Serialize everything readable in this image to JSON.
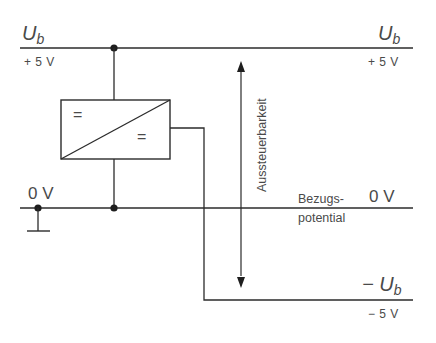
{
  "diagram": {
    "type": "circuit-schematic",
    "rails": {
      "top_left": {
        "symbol": "U",
        "subscript": "b",
        "voltage": "+ 5 V"
      },
      "top_right": {
        "symbol": "U",
        "subscript": "b",
        "voltage": "+ 5 V"
      },
      "bottom_right": {
        "symbol": "− U",
        "subscript": "b",
        "voltage": "− 5 V"
      },
      "ground_left": {
        "voltage": "0 V"
      },
      "ground_right": {
        "voltage": "0 V"
      }
    },
    "converter": {
      "input_symbol": "=",
      "output_symbol": "="
    },
    "labels": {
      "swing": "Aussteuerbarkeit",
      "reference_line1": "Bezugs-",
      "reference_line2": "potential"
    },
    "colors": {
      "line": "#2b2b2b",
      "text": "#4a4a4a",
      "background": "#ffffff"
    }
  }
}
